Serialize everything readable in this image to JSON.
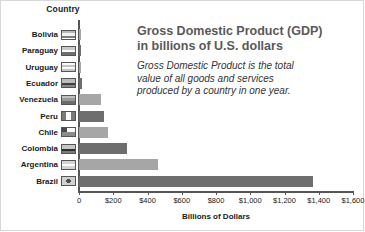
{
  "chart_data": {
    "type": "bar",
    "orientation": "horizontal",
    "title": "Gross Domestic Product (GDP) in billions of U.S. dollars",
    "title_line1": "Gross Domestic Product (GDP)",
    "title_line2": "in billions of U.S. dollars",
    "subtitle": "Gross Domestic Product is the total value of all goods and services produced by a country in one year.",
    "subtitle_line1": "Gross Domestic Product is the total",
    "subtitle_line2": "value of all goods and services",
    "subtitle_line3": "produced by a country in one year.",
    "category_axis_title": "Country",
    "xlabel": "Billions of Dollars",
    "ylabel": "Country",
    "xlim": [
      0,
      1600
    ],
    "grid": false,
    "legend": "none",
    "tick_labels": [
      "0",
      "$200",
      "$400",
      "$600",
      "$800",
      "$1,000",
      "$1,200",
      "$1,400",
      "$1,600"
    ],
    "tick_values": [
      0,
      200,
      400,
      600,
      800,
      1000,
      1200,
      1400,
      1600
    ],
    "categories": [
      "Bolivia",
      "Paraguay",
      "Uruguay",
      "Ecuador",
      "Venezuela",
      "Peru",
      "Chile",
      "Colombia",
      "Argentina",
      "Brazil"
    ],
    "values": [
      8,
      7,
      12,
      18,
      128,
      145,
      170,
      280,
      460,
      1366
    ],
    "bars": [
      {
        "country": "Bolivia",
        "value": 8,
        "shade": "light",
        "flag": "bolivia-flag"
      },
      {
        "country": "Paraguay",
        "value": 7,
        "shade": "dark",
        "flag": "paraguay-flag"
      },
      {
        "country": "Uruguay",
        "value": 12,
        "shade": "light",
        "flag": "uruguay-flag"
      },
      {
        "country": "Ecuador",
        "value": 18,
        "shade": "dark",
        "flag": "ecuador-flag"
      },
      {
        "country": "Venezuela",
        "value": 128,
        "shade": "light",
        "flag": "venezuela-flag"
      },
      {
        "country": "Peru",
        "value": 145,
        "shade": "dark",
        "flag": "peru-flag"
      },
      {
        "country": "Chile",
        "value": 170,
        "shade": "light",
        "flag": "chile-flag"
      },
      {
        "country": "Colombia",
        "value": 280,
        "shade": "dark",
        "flag": "colombia-flag"
      },
      {
        "country": "Argentina",
        "value": 460,
        "shade": "light",
        "flag": "argentina-flag"
      },
      {
        "country": "Brazil",
        "value": 1366,
        "shade": "dark",
        "flag": "brazil-flag"
      }
    ],
    "colors": {
      "bar_light": "#a6a6a6",
      "bar_dark": "#6e6e6e",
      "axis": "#555555",
      "title_text": "#595959",
      "body_text": "#1a1a1a",
      "background": "#ffffff"
    }
  }
}
